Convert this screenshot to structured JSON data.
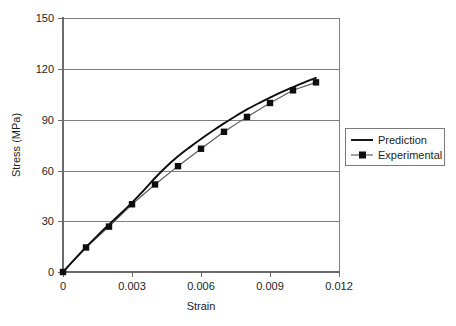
{
  "chart_data": {
    "type": "line",
    "title": "",
    "xlabel": "Strain",
    "ylabel": "Stress (MPa)",
    "xlim": [
      0,
      0.012
    ],
    "ylim": [
      0,
      150
    ],
    "grid": "horizontal",
    "legend_position": "right",
    "x_ticks": [
      "0",
      "0.003",
      "0.006",
      "0.009",
      "0.012"
    ],
    "x_tick_values": [
      0,
      0.003,
      0.006,
      0.009,
      0.012
    ],
    "y_ticks": [
      "0",
      "30",
      "60",
      "90",
      "120",
      "150"
    ],
    "y_tick_values": [
      0,
      30,
      60,
      90,
      120,
      150
    ],
    "series": [
      {
        "name": "Prediction",
        "marker": "none",
        "color": "#0d0d0d",
        "x": [
          0,
          0.0005,
          0.001,
          0.0015,
          0.002,
          0.0025,
          0.003,
          0.0035,
          0.004,
          0.0045,
          0.005,
          0.0055,
          0.006,
          0.0065,
          0.007,
          0.0075,
          0.008,
          0.0085,
          0.009,
          0.0095,
          0.01,
          0.0105,
          0.011
        ],
        "values": [
          0,
          7.4,
          14.6,
          21.5,
          28.0,
          34.4,
          41.0,
          48.0,
          55.5,
          62.3,
          68.3,
          73.6,
          78.6,
          83.3,
          87.8,
          92.0,
          96.0,
          99.6,
          103.0,
          106.2,
          109.2,
          112.0,
          114.6
        ]
      },
      {
        "name": "Experimental",
        "marker": "square",
        "color": "#5a5a5a",
        "x": [
          0,
          0.001,
          0.002,
          0.003,
          0.004,
          0.005,
          0.006,
          0.007,
          0.008,
          0.009,
          0.01,
          0.011
        ],
        "values": [
          0,
          14.5,
          26.8,
          40.0,
          51.7,
          62.5,
          72.8,
          82.8,
          91.6,
          99.8,
          107.3,
          112.0
        ]
      }
    ]
  },
  "legend": {
    "entries": [
      {
        "label": "Prediction"
      },
      {
        "label": "Experimental"
      }
    ]
  },
  "axes": {
    "y_axis_title": "Stress (MPa)",
    "x_axis_title": "Strain"
  }
}
